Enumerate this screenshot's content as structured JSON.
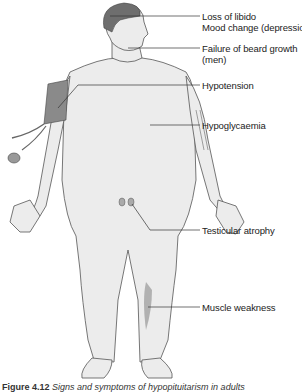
{
  "figure": {
    "labels": [
      {
        "id": "libido",
        "lines": [
          "Loss of libido",
          "Mood change (depression)"
        ]
      },
      {
        "id": "beard",
        "lines": [
          "Failure of beard growth",
          "(men)"
        ]
      },
      {
        "id": "hypotension",
        "lines": [
          "Hypotension"
        ]
      },
      {
        "id": "hypoglycaemia",
        "lines": [
          "Hypoglycaemia"
        ]
      },
      {
        "id": "testicular",
        "lines": [
          "Testicular atrophy"
        ]
      },
      {
        "id": "muscle",
        "lines": [
          "Muscle weakness"
        ]
      }
    ],
    "caption": {
      "number": "Figure 4.12",
      "text": "Signs and symptoms of hypopituitarism in adults"
    },
    "colors": {
      "skin": "#ececec",
      "hair": "#6e6e6e",
      "outline": "#555555",
      "cuff": "#8a8a8a",
      "leader_line": "#333333"
    }
  }
}
